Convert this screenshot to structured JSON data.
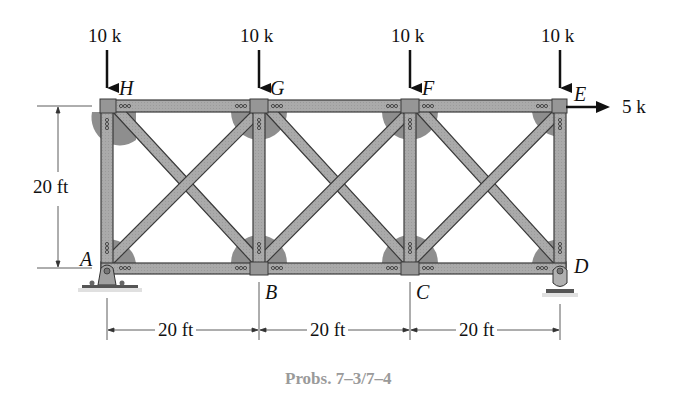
{
  "figure": {
    "caption": "Probs. 7–3/7–4",
    "type": "planar truss with cross-bracing"
  },
  "joints": {
    "top": [
      {
        "id": "H",
        "label": "H"
      },
      {
        "id": "G",
        "label": "G"
      },
      {
        "id": "F",
        "label": "F"
      },
      {
        "id": "E",
        "label": "E"
      }
    ],
    "bottom": [
      {
        "id": "A",
        "label": "A"
      },
      {
        "id": "B",
        "label": "B"
      },
      {
        "id": "C",
        "label": "C"
      },
      {
        "id": "D",
        "label": "D"
      }
    ]
  },
  "loads": {
    "vertical": [
      {
        "at": "H",
        "label": "10 k",
        "direction": "down"
      },
      {
        "at": "G",
        "label": "10 k",
        "direction": "down"
      },
      {
        "at": "F",
        "label": "10 k",
        "direction": "down"
      },
      {
        "at": "E",
        "label": "10 k",
        "direction": "down"
      }
    ],
    "horizontal": {
      "at": "E",
      "label": "5 k",
      "direction": "right"
    }
  },
  "dimensions": {
    "height": "20 ft",
    "spans": [
      "20 ft",
      "20 ft",
      "20 ft"
    ]
  },
  "supports": {
    "A": "pin",
    "D": "rocker"
  },
  "colors": {
    "member_fill": "#a8a8a8",
    "member_edge": "#3a3a3a",
    "gusset": "#8e8e8e",
    "joint_plate": "#9a9a9a",
    "caption": "#9a9a9a",
    "ink": "#111111"
  }
}
